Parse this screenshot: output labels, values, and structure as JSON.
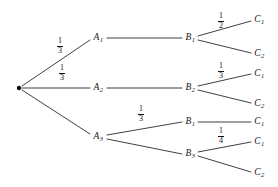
{
  "figure": {
    "type": "probability-tree-diagram",
    "stroke_color": "#2a2a2a",
    "text_color": "#141414",
    "background": "#ffffff",
    "width": 278,
    "height": 187
  },
  "root": {
    "name": "root-node",
    "x": 19,
    "y": 88
  },
  "nodes": [
    {
      "id": "A1",
      "letter": "A",
      "sub": "1",
      "x": 98,
      "y": 38,
      "level": 1
    },
    {
      "id": "A2",
      "letter": "A",
      "sub": "2",
      "x": 98,
      "y": 88,
      "level": 1
    },
    {
      "id": "A3",
      "letter": "A",
      "sub": "3",
      "x": 98,
      "y": 137,
      "level": 1
    },
    {
      "id": "B1a",
      "letter": "B",
      "sub": "1",
      "x": 190,
      "y": 38,
      "level": 2
    },
    {
      "id": "B2",
      "letter": "B",
      "sub": "2",
      "x": 190,
      "y": 88,
      "level": 2
    },
    {
      "id": "B1b",
      "letter": "B",
      "sub": "1",
      "x": 190,
      "y": 122,
      "level": 2
    },
    {
      "id": "B3",
      "letter": "B",
      "sub": "3",
      "x": 190,
      "y": 154,
      "level": 2
    },
    {
      "id": "C1a",
      "letter": "C",
      "sub": "1",
      "x": 259,
      "y": 20,
      "level": 3
    },
    {
      "id": "C2a",
      "letter": "C",
      "sub": "2",
      "x": 259,
      "y": 54,
      "level": 3
    },
    {
      "id": "C1b",
      "letter": "C",
      "sub": "1",
      "x": 259,
      "y": 74,
      "level": 3
    },
    {
      "id": "C2b",
      "letter": "C",
      "sub": "2",
      "x": 259,
      "y": 104,
      "level": 3
    },
    {
      "id": "C1c",
      "letter": "C",
      "sub": "1",
      "x": 259,
      "y": 122,
      "level": 3
    },
    {
      "id": "C1d",
      "letter": "C",
      "sub": "1",
      "x": 259,
      "y": 142,
      "level": 3
    },
    {
      "id": "C2c",
      "letter": "C",
      "sub": "2",
      "x": 259,
      "y": 173,
      "level": 3
    }
  ],
  "edges": [
    {
      "id": "root-A1",
      "x1": 22,
      "y1": 86,
      "x2": 90,
      "y2": 40
    },
    {
      "id": "root-A2",
      "x1": 22,
      "y1": 88,
      "x2": 90,
      "y2": 88
    },
    {
      "id": "root-A3",
      "x1": 22,
      "y1": 90,
      "x2": 90,
      "y2": 134
    },
    {
      "id": "A1-B1a",
      "x1": 107,
      "y1": 38,
      "x2": 182,
      "y2": 38
    },
    {
      "id": "A2-B2",
      "x1": 107,
      "y1": 88,
      "x2": 182,
      "y2": 88
    },
    {
      "id": "A3-B1b",
      "x1": 107,
      "y1": 135,
      "x2": 182,
      "y2": 122
    },
    {
      "id": "A3-B3",
      "x1": 107,
      "y1": 139,
      "x2": 182,
      "y2": 154
    },
    {
      "id": "B1a-C1a",
      "x1": 198,
      "y1": 36,
      "x2": 251,
      "y2": 21
    },
    {
      "id": "B1a-C2a",
      "x1": 198,
      "y1": 40,
      "x2": 251,
      "y2": 53
    },
    {
      "id": "B2-C1b",
      "x1": 198,
      "y1": 86,
      "x2": 251,
      "y2": 74
    },
    {
      "id": "B2-C2b",
      "x1": 198,
      "y1": 90,
      "x2": 251,
      "y2": 103
    },
    {
      "id": "B1b-C1c",
      "x1": 198,
      "y1": 122,
      "x2": 251,
      "y2": 122
    },
    {
      "id": "B3-C1d",
      "x1": 198,
      "y1": 152,
      "x2": 251,
      "y2": 142
    },
    {
      "id": "B3-C2c",
      "x1": 198,
      "y1": 156,
      "x2": 251,
      "y2": 172
    }
  ],
  "probabilities": [
    {
      "id": "p-root-A1",
      "numerator": "1",
      "denominator": "3",
      "x": 60,
      "y": 46,
      "edge": "root-A1"
    },
    {
      "id": "p-root-A2",
      "numerator": "1",
      "denominator": "3",
      "x": 62,
      "y": 73,
      "edge": "root-A2"
    },
    {
      "id": "p-A3-B1b",
      "numerator": "1",
      "denominator": "3",
      "x": 141,
      "y": 114,
      "edge": "A3-B1b"
    },
    {
      "id": "p-B1a-C1a",
      "numerator": "1",
      "denominator": "2",
      "x": 221,
      "y": 21,
      "edge": "B1a-C1a"
    },
    {
      "id": "p-B2-C1b",
      "numerator": "1",
      "denominator": "3",
      "x": 221,
      "y": 71,
      "edge": "B2-C1b"
    },
    {
      "id": "p-B3-C1d",
      "numerator": "1",
      "denominator": "4",
      "x": 221,
      "y": 136,
      "edge": "B3-C1d"
    }
  ]
}
